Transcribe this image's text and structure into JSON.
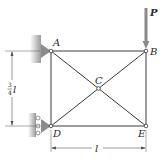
{
  "diagram": {
    "type": "truss",
    "nodes": [
      {
        "id": "A",
        "label": "A",
        "x": 51,
        "y": 51
      },
      {
        "id": "B",
        "label": "B",
        "x": 146,
        "y": 51
      },
      {
        "id": "C",
        "label": "C",
        "x": 98,
        "y": 88
      },
      {
        "id": "D",
        "label": "D",
        "x": 51,
        "y": 126
      },
      {
        "id": "E",
        "label": "E",
        "x": 146,
        "y": 126
      }
    ],
    "members": [
      [
        "A",
        "B"
      ],
      [
        "A",
        "D"
      ],
      [
        "B",
        "E"
      ],
      [
        "D",
        "E"
      ],
      [
        "A",
        "C"
      ],
      [
        "C",
        "E"
      ],
      [
        "D",
        "C"
      ],
      [
        "C",
        "B"
      ]
    ],
    "supports": [
      {
        "node": "A",
        "type": "pin"
      },
      {
        "node": "D",
        "type": "roller"
      }
    ],
    "load": {
      "node": "B",
      "label": "P",
      "direction": "down"
    },
    "dimensions": {
      "vertical": {
        "numerator": "3",
        "denominator": "4",
        "symbol": "l"
      },
      "horizontal": {
        "symbol": "l"
      }
    },
    "colors": {
      "member": "#3a3a3a",
      "support": "#8a8a8a",
      "wall": "#b5b5b5",
      "arrow": "#7a7a7a"
    }
  }
}
